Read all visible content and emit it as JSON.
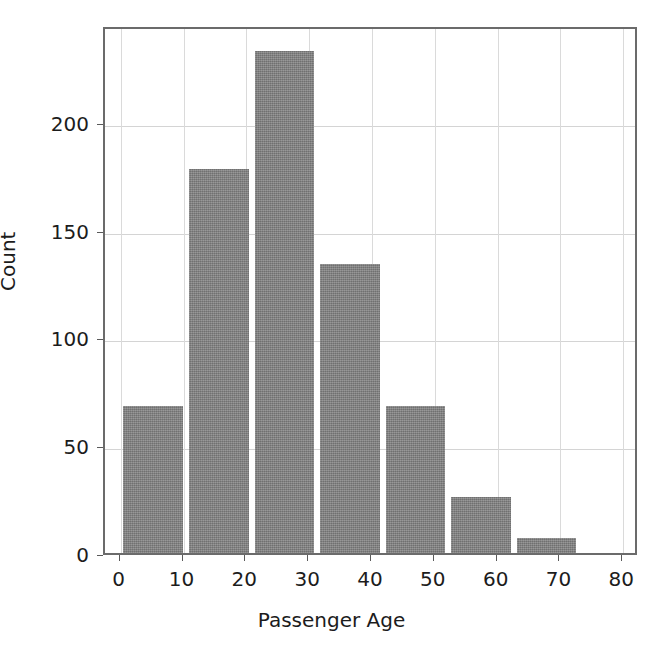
{
  "chart_data": {
    "type": "bar",
    "title": "",
    "subtitle": "",
    "xlabel": "Passenger Age",
    "ylabel": "Count",
    "xlim": [
      -2.5,
      82.5
    ],
    "ylim": [
      0,
      245
    ],
    "grid": true,
    "legend": null,
    "bar_color": "#808080",
    "categories": [
      "0–10.4",
      "10.4–20.9",
      "20.9–31.3",
      "31.3–41.7",
      "41.7–52.1",
      "52.1–62.6",
      "62.6–73.0"
    ],
    "bin_edges": [
      0.42,
      10.9,
      21.3,
      31.8,
      42.2,
      52.6,
      63.1,
      73.5
    ],
    "values": [
      68,
      178,
      233,
      134,
      68,
      26,
      7
    ],
    "x_ticks": [
      0,
      10,
      20,
      30,
      40,
      50,
      60,
      70,
      80
    ],
    "x_tick_labels": [
      "0",
      "10",
      "20",
      "30",
      "40",
      "50",
      "60",
      "70",
      "80"
    ],
    "y_ticks": [
      0,
      50,
      100,
      150,
      200
    ],
    "y_tick_labels": [
      "0",
      "50",
      "100",
      "150",
      "200"
    ],
    "annotations": []
  }
}
